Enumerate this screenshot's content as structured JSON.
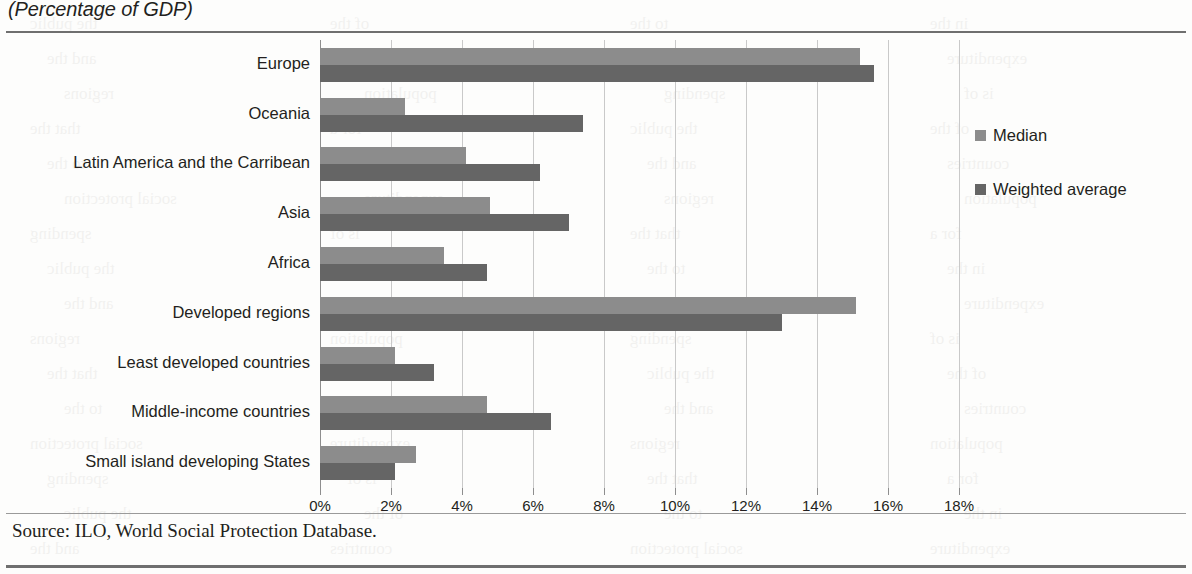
{
  "subtitle": "(Percentage of GDP)",
  "source_note": "Source: ILO, World Social Protection Database.",
  "legend": {
    "median_label": "Median",
    "weighted_label": "Weighted average"
  },
  "colors": {
    "median": "#8c8c8c",
    "weighted_average": "#656565",
    "gridline": "#c9c9c9",
    "axis": "#8e8e8e",
    "rule": "#6f6f6f",
    "text": "#231f20"
  },
  "chart_data": {
    "type": "bar",
    "orientation": "horizontal",
    "title": "",
    "subtitle": "(Percentage of GDP)",
    "xlabel": "",
    "ylabel": "",
    "xlim": [
      0,
      18
    ],
    "xticks": [
      0,
      2,
      4,
      6,
      8,
      10,
      12,
      14,
      16,
      18
    ],
    "xtick_labels": [
      "0%",
      "2%",
      "4%",
      "6%",
      "8%",
      "10%",
      "12%",
      "14%",
      "16%",
      "18%"
    ],
    "grid": true,
    "legend_position": "right",
    "categories": [
      "Europe",
      "Oceania",
      "Latin America and the Carribean",
      "Asia",
      "Africa",
      "Developed regions",
      "Least developed countries",
      "Middle-income countries",
      "Small island developing States"
    ],
    "series": [
      {
        "name": "Median",
        "values": [
          15.2,
          2.4,
          4.1,
          4.8,
          3.5,
          15.1,
          2.1,
          4.7,
          2.7
        ]
      },
      {
        "name": "Weighted average",
        "values": [
          15.6,
          7.4,
          6.2,
          7.0,
          4.7,
          13.0,
          3.2,
          6.5,
          2.1
        ]
      }
    ]
  },
  "bleed_text": [
    "the public",
    "of the",
    "to the",
    "in the",
    "and the",
    "countries",
    "social protection",
    "expenditure",
    "regions",
    "population",
    "spending",
    "is of",
    "that the",
    "for a"
  ]
}
